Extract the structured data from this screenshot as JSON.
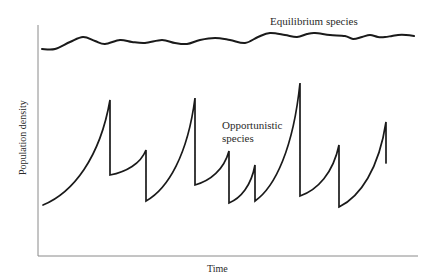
{
  "chart_data": {
    "type": "line",
    "title": "",
    "xlabel": "Time",
    "ylabel": "Population density",
    "grid": false,
    "legend": "inline annotations",
    "axis_ticks": "none (unlabeled axes)",
    "series": [
      {
        "name": "Equilibrium species",
        "description": "Stays near carrying capacity with small oscillations",
        "points_px": [
          [
            42,
            49
          ],
          [
            55,
            49
          ],
          [
            70,
            42
          ],
          [
            83,
            37
          ],
          [
            95,
            41
          ],
          [
            105,
            44
          ],
          [
            120,
            40
          ],
          [
            132,
            42
          ],
          [
            145,
            43
          ],
          [
            162,
            40
          ],
          [
            175,
            43
          ],
          [
            187,
            44
          ],
          [
            200,
            40
          ],
          [
            215,
            38
          ],
          [
            230,
            40
          ],
          [
            245,
            43
          ],
          [
            258,
            37
          ],
          [
            270,
            33
          ],
          [
            285,
            35
          ],
          [
            297,
            37
          ],
          [
            307,
            34
          ],
          [
            315,
            33
          ],
          [
            330,
            35
          ],
          [
            345,
            36
          ],
          [
            353,
            39
          ],
          [
            362,
            37
          ],
          [
            370,
            35
          ],
          [
            378,
            37
          ],
          [
            385,
            37
          ],
          [
            392,
            36
          ],
          [
            398,
            35
          ],
          [
            406,
            35
          ],
          [
            414,
            36
          ]
        ]
      },
      {
        "name": "Opportunistic species",
        "description": "Boom-and-bust cycles: exponential rise then sudden crash",
        "cycles": [
          {
            "start_y": 205,
            "peak_x": 110,
            "peak_y": 100,
            "crash_to_y": 175
          },
          {
            "start_y": 175,
            "peak_x": 146,
            "peak_y": 150,
            "crash_to_y": 201
          },
          {
            "start_y": 201,
            "peak_x": 195,
            "peak_y": 98,
            "crash_to_y": 185
          },
          {
            "start_y": 185,
            "peak_x": 229,
            "peak_y": 151,
            "crash_to_y": 203
          },
          {
            "start_y": 203,
            "peak_x": 255,
            "peak_y": 165,
            "crash_to_y": 201
          },
          {
            "start_y": 201,
            "peak_x": 300,
            "peak_y": 83,
            "crash_to_y": 196
          },
          {
            "start_y": 196,
            "peak_x": 339,
            "peak_y": 145,
            "crash_to_y": 207
          },
          {
            "start_y": 207,
            "peak_x": 386,
            "peak_y": 122,
            "crash_to_y": 163
          }
        ],
        "start_x": 43
      }
    ],
    "annotations": [
      {
        "text": "Equilibrium species",
        "x": 320,
        "y": 22
      },
      {
        "text": "Opportunistic species",
        "x": 222,
        "y": 127,
        "lines": [
          "Opportunistic",
          "species"
        ]
      }
    ]
  },
  "labels": {
    "x_axis": "Time",
    "y_axis": "Population density",
    "equilibrium": "Equilibrium species",
    "opportunistic_line1": "Opportunistic",
    "opportunistic_line2": "species"
  },
  "colors": {
    "curve": "#1a1a1a",
    "axis": "#8a8a8a",
    "text": "#2a2a2a",
    "background": "#ffffff"
  }
}
